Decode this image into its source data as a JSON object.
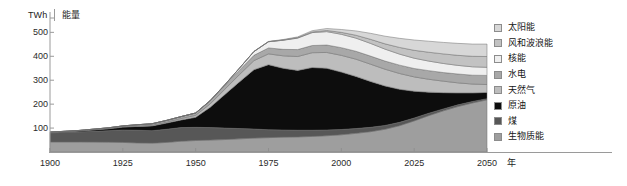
{
  "axes": {
    "unit": "TWh",
    "y_title": "能量",
    "x_title": "年",
    "y_ticks": [
      100,
      200,
      300,
      400,
      500
    ],
    "x_ticks": [
      1900,
      1925,
      1950,
      1975,
      2000,
      2025,
      2050
    ],
    "ylim": [
      0,
      560
    ],
    "xlim": [
      1900,
      2050
    ],
    "grid": false
  },
  "legend": {
    "position": "right",
    "items": [
      {
        "label": "太阳能",
        "color": "#d7d7d7",
        "key": "solar"
      },
      {
        "label": "风和波浪能",
        "color": "#c2c2c2",
        "key": "wind-wave"
      },
      {
        "label": "核能",
        "color": "#efefef",
        "key": "nuclear"
      },
      {
        "label": "水电",
        "color": "#a8a8a8",
        "key": "hydro"
      },
      {
        "label": "天然气",
        "color": "#bdbdbd",
        "key": "natural-gas"
      },
      {
        "label": "原油",
        "color": "#0d0d0d",
        "key": "crude-oil"
      },
      {
        "label": "煤",
        "color": "#575757",
        "key": "coal"
      },
      {
        "label": "生物质能",
        "color": "#9e9e9e",
        "key": "biomass"
      }
    ]
  },
  "chart_data": {
    "type": "area",
    "title": "",
    "xlabel": "年",
    "ylabel": "能量",
    "unit": "TWh",
    "stacked": true,
    "stack_order_bottom_to_top": [
      "生物质能",
      "煤",
      "原油",
      "天然气",
      "水电",
      "核能",
      "风和波浪能",
      "太阳能"
    ],
    "x": [
      1900,
      1910,
      1920,
      1925,
      1930,
      1935,
      1940,
      1945,
      1950,
      1955,
      1960,
      1965,
      1970,
      1975,
      1980,
      1985,
      1990,
      1995,
      2000,
      2005,
      2010,
      2015,
      2020,
      2025,
      2030,
      2035,
      2040,
      2045,
      2050
    ],
    "series": [
      {
        "name": "生物质能",
        "color": "#9e9e9e",
        "values": [
          42,
          42,
          41,
          40,
          38,
          37,
          40,
          45,
          48,
          50,
          52,
          55,
          58,
          60,
          62,
          63,
          65,
          68,
          72,
          78,
          85,
          95,
          110,
          130,
          152,
          172,
          190,
          205,
          218
        ]
      },
      {
        "name": "煤",
        "color": "#575757",
        "values": [
          38,
          42,
          48,
          52,
          53,
          52,
          55,
          57,
          55,
          52,
          48,
          43,
          38,
          33,
          30,
          28,
          26,
          24,
          22,
          20,
          18,
          16,
          14,
          12,
          10,
          8,
          7,
          6,
          5
        ]
      },
      {
        "name": "原油",
        "color": "#0d0d0d",
        "values": [
          2,
          4,
          8,
          12,
          16,
          20,
          26,
          32,
          42,
          85,
          140,
          195,
          248,
          272,
          258,
          250,
          262,
          258,
          240,
          218,
          192,
          165,
          138,
          112,
          88,
          68,
          50,
          36,
          26
        ]
      },
      {
        "name": "天然气",
        "color": "#bdbdbd",
        "values": [
          0,
          0,
          1,
          1,
          2,
          3,
          4,
          6,
          8,
          14,
          22,
          30,
          38,
          45,
          52,
          58,
          62,
          66,
          70,
          72,
          72,
          70,
          66,
          60,
          54,
          48,
          42,
          37,
          33
        ]
      },
      {
        "name": "水电",
        "color": "#a8a8a8",
        "values": [
          1,
          2,
          3,
          4,
          5,
          6,
          7,
          8,
          10,
          13,
          16,
          19,
          22,
          25,
          27,
          29,
          30,
          31,
          32,
          33,
          34,
          34,
          35,
          35,
          36,
          36,
          37,
          37,
          38
        ]
      },
      {
        "name": "核能",
        "color": "#efefef",
        "values": [
          0,
          0,
          0,
          0,
          0,
          0,
          0,
          0,
          0,
          1,
          3,
          8,
          16,
          26,
          38,
          48,
          54,
          56,
          56,
          55,
          53,
          50,
          46,
          43,
          40,
          38,
          36,
          35,
          34
        ]
      },
      {
        "name": "风和波浪能",
        "color": "#c2c2c2",
        "values": [
          0,
          0,
          0,
          0,
          0,
          0,
          0,
          0,
          0,
          0,
          0,
          0,
          0,
          0,
          1,
          2,
          3,
          5,
          8,
          12,
          17,
          22,
          28,
          33,
          37,
          40,
          42,
          44,
          45
        ]
      },
      {
        "name": "太阳能",
        "color": "#d7d7d7",
        "values": [
          0,
          0,
          0,
          0,
          0,
          0,
          0,
          0,
          0,
          0,
          0,
          0,
          0,
          1,
          2,
          3,
          5,
          8,
          12,
          18,
          25,
          32,
          38,
          43,
          46,
          48,
          50,
          51,
          52
        ]
      }
    ]
  }
}
